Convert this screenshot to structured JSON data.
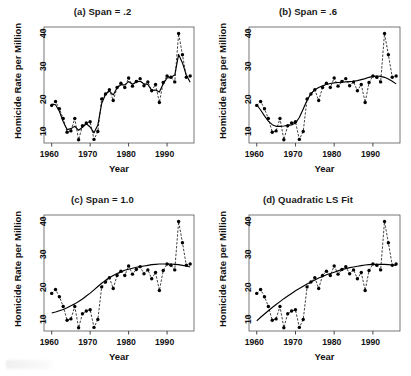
{
  "figure": {
    "caption_fragment": "",
    "xlabel": "Year",
    "ylabel": "Homicide Rate per Million",
    "xticks": [
      "1960",
      "1970",
      "1980",
      "1990"
    ],
    "yticks": [
      "10",
      "20",
      "30",
      "40"
    ]
  },
  "panels": [
    {
      "key": "a",
      "title": "(a) Span = .2"
    },
    {
      "key": "b",
      "title": "(b) Span = .6"
    },
    {
      "key": "c",
      "title": "(c) Span = 1.0"
    },
    {
      "key": "d",
      "title": "(d) Quadratic LS Fit"
    }
  ],
  "chart_data": [
    {
      "type": "line",
      "title": "(a) Span = .2",
      "xlabel": "Year",
      "ylabel": "Homicide Rate per Million",
      "xlim": [
        1958,
        1997
      ],
      "ylim": [
        5.5,
        41
      ],
      "xticks": [
        1960,
        1970,
        1980,
        1990
      ],
      "yticks": [
        10,
        20,
        30,
        40
      ],
      "grid": false,
      "legend": "none",
      "series": [
        {
          "name": "Homicide rate (observed)",
          "style": "points-with-dashed-line",
          "x": [
            1960,
            1961,
            1962,
            1963,
            1964,
            1965,
            1966,
            1967,
            1968,
            1969,
            1970,
            1971,
            1972,
            1973,
            1974,
            1975,
            1976,
            1977,
            1978,
            1979,
            1980,
            1981,
            1982,
            1983,
            1984,
            1985,
            1986,
            1987,
            1988,
            1989,
            1990,
            1991,
            1992,
            1993,
            1994,
            1995,
            1996
          ],
          "values": [
            17.0,
            18.2,
            16.0,
            13.0,
            8.8,
            9.2,
            13.0,
            6.5,
            10.8,
            11.6,
            12.0,
            6.6,
            9.0,
            19.0,
            20.5,
            21.8,
            18.5,
            22.5,
            23.8,
            22.5,
            25.4,
            22.9,
            24.3,
            25.2,
            23.0,
            24.2,
            21.5,
            23.4,
            17.9,
            24.0,
            26.0,
            25.6,
            24.2,
            39.0,
            32.5,
            25.6,
            26.0
          ]
        },
        {
          "name": "Loess smooth, span = .2",
          "style": "solid-line",
          "x": [
            1960,
            1961,
            1962,
            1963,
            1964,
            1965,
            1966,
            1967,
            1968,
            1969,
            1970,
            1971,
            1972,
            1973,
            1974,
            1975,
            1976,
            1977,
            1978,
            1979,
            1980,
            1981,
            1982,
            1983,
            1984,
            1985,
            1986,
            1987,
            1988,
            1989,
            1990,
            1991,
            1992,
            1993,
            1994,
            1995,
            1996
          ],
          "values": [
            17.4,
            17.2,
            15.2,
            12.0,
            9.6,
            9.9,
            10.6,
            9.4,
            10.3,
            11.4,
            10.4,
            8.6,
            11.0,
            17.6,
            20.4,
            21.4,
            20.2,
            22.4,
            23.3,
            23.3,
            24.3,
            23.5,
            24.2,
            24.4,
            23.6,
            23.4,
            21.6,
            21.7,
            21.1,
            23.6,
            25.4,
            25.6,
            26.3,
            32.6,
            30.0,
            26.3,
            24.1
          ]
        }
      ]
    },
    {
      "type": "line",
      "title": "(b) Span = .6",
      "xlabel": "Year",
      "ylabel": "Homicide Rate per Million",
      "xlim": [
        1958,
        1997
      ],
      "ylim": [
        5.5,
        41
      ],
      "xticks": [
        1960,
        1970,
        1980,
        1990
      ],
      "yticks": [
        10,
        20,
        30,
        40
      ],
      "grid": false,
      "legend": "none",
      "series": [
        {
          "name": "Homicide rate (observed)",
          "style": "points-with-dashed-line",
          "x": [
            1960,
            1961,
            1962,
            1963,
            1964,
            1965,
            1966,
            1967,
            1968,
            1969,
            1970,
            1971,
            1972,
            1973,
            1974,
            1975,
            1976,
            1977,
            1978,
            1979,
            1980,
            1981,
            1982,
            1983,
            1984,
            1985,
            1986,
            1987,
            1988,
            1989,
            1990,
            1991,
            1992,
            1993,
            1994,
            1995,
            1996
          ],
          "values": [
            17.0,
            18.2,
            16.0,
            13.0,
            8.8,
            9.2,
            13.0,
            6.5,
            10.8,
            11.6,
            12.0,
            6.6,
            9.0,
            19.0,
            20.5,
            21.8,
            18.5,
            22.5,
            23.8,
            22.5,
            25.4,
            22.9,
            24.3,
            25.2,
            23.0,
            24.2,
            21.5,
            23.4,
            17.9,
            24.0,
            26.0,
            25.6,
            24.2,
            39.0,
            32.5,
            25.6,
            26.0
          ]
        },
        {
          "name": "Loess smooth, span = .6",
          "style": "solid-line",
          "x": [
            1960,
            1961,
            1962,
            1963,
            1964,
            1965,
            1966,
            1967,
            1968,
            1969,
            1970,
            1971,
            1972,
            1973,
            1974,
            1975,
            1976,
            1977,
            1978,
            1979,
            1980,
            1981,
            1982,
            1983,
            1984,
            1985,
            1986,
            1987,
            1988,
            1989,
            1990,
            1991,
            1992,
            1993,
            1994,
            1995,
            1996
          ],
          "values": [
            17.2,
            15.6,
            13.8,
            12.2,
            11.1,
            10.6,
            10.6,
            10.7,
            10.9,
            11.0,
            11.6,
            13.3,
            15.9,
            18.6,
            20.6,
            21.8,
            22.5,
            23.0,
            23.4,
            23.7,
            23.9,
            24.0,
            24.1,
            24.2,
            24.3,
            24.4,
            24.6,
            24.9,
            25.2,
            25.6,
            25.9,
            26.0,
            25.9,
            25.6,
            25.1,
            24.4,
            23.6
          ]
        }
      ]
    },
    {
      "type": "line",
      "title": "(c) Span = 1.0",
      "xlabel": "Year",
      "ylabel": "Homicide Rate per Million",
      "xlim": [
        1958,
        1997
      ],
      "ylim": [
        5.5,
        41
      ],
      "xticks": [
        1960,
        1970,
        1980,
        1990
      ],
      "yticks": [
        10,
        20,
        30,
        40
      ],
      "grid": false,
      "legend": "none",
      "series": [
        {
          "name": "Homicide rate (observed)",
          "style": "points-with-dashed-line",
          "x": [
            1960,
            1961,
            1962,
            1963,
            1964,
            1965,
            1966,
            1967,
            1968,
            1969,
            1970,
            1971,
            1972,
            1973,
            1974,
            1975,
            1976,
            1977,
            1978,
            1979,
            1980,
            1981,
            1982,
            1983,
            1984,
            1985,
            1986,
            1987,
            1988,
            1989,
            1990,
            1991,
            1992,
            1993,
            1994,
            1995,
            1996
          ],
          "values": [
            17.0,
            18.2,
            16.0,
            13.0,
            8.8,
            9.2,
            13.0,
            6.5,
            10.8,
            11.6,
            12.0,
            6.6,
            9.0,
            19.0,
            20.5,
            21.8,
            18.5,
            22.5,
            23.8,
            22.5,
            25.4,
            22.9,
            24.3,
            25.2,
            23.0,
            24.2,
            21.5,
            23.4,
            17.9,
            24.0,
            26.0,
            25.6,
            24.2,
            39.0,
            32.5,
            25.6,
            26.0
          ]
        },
        {
          "name": "Loess smooth, span = 1.0",
          "style": "solid-line",
          "x": [
            1960,
            1961,
            1962,
            1963,
            1964,
            1965,
            1966,
            1967,
            1968,
            1969,
            1970,
            1971,
            1972,
            1973,
            1974,
            1975,
            1976,
            1977,
            1978,
            1979,
            1980,
            1981,
            1982,
            1983,
            1984,
            1985,
            1986,
            1987,
            1988,
            1989,
            1990,
            1991,
            1992,
            1993,
            1994,
            1995,
            1996
          ],
          "values": [
            11.0,
            11.3,
            11.7,
            12.1,
            12.6,
            13.2,
            13.8,
            14.5,
            15.3,
            16.2,
            17.1,
            18.1,
            19.1,
            20.1,
            21.0,
            21.8,
            22.5,
            23.1,
            23.6,
            24.1,
            24.4,
            24.7,
            25.0,
            25.2,
            25.4,
            25.6,
            25.8,
            25.9,
            26.0,
            26.0,
            26.0,
            26.0,
            25.9,
            25.8,
            25.6,
            25.4,
            25.1
          ]
        }
      ]
    },
    {
      "type": "line",
      "title": "(d) Quadratic LS Fit",
      "xlabel": "Year",
      "ylabel": "Homicide Rate per Million",
      "xlim": [
        1958,
        1997
      ],
      "ylim": [
        5.5,
        41
      ],
      "xticks": [
        1960,
        1970,
        1980,
        1990
      ],
      "yticks": [
        10,
        20,
        30,
        40
      ],
      "grid": false,
      "legend": "none",
      "series": [
        {
          "name": "Homicide rate (observed)",
          "style": "points-with-dashed-line",
          "x": [
            1960,
            1961,
            1962,
            1963,
            1964,
            1965,
            1966,
            1967,
            1968,
            1969,
            1970,
            1971,
            1972,
            1973,
            1974,
            1975,
            1976,
            1977,
            1978,
            1979,
            1980,
            1981,
            1982,
            1983,
            1984,
            1985,
            1986,
            1987,
            1988,
            1989,
            1990,
            1991,
            1992,
            1993,
            1994,
            1995,
            1996
          ],
          "values": [
            17.0,
            18.2,
            16.0,
            13.0,
            8.8,
            9.2,
            13.0,
            6.5,
            10.8,
            11.6,
            12.0,
            6.6,
            9.0,
            19.0,
            20.5,
            21.8,
            18.5,
            22.5,
            23.8,
            22.5,
            25.4,
            22.9,
            24.3,
            25.2,
            23.0,
            24.2,
            21.5,
            23.4,
            17.9,
            24.0,
            26.0,
            25.6,
            24.2,
            39.0,
            32.5,
            25.6,
            26.0
          ]
        },
        {
          "name": "Quadratic least-squares fit",
          "style": "solid-line",
          "x": [
            1960,
            1961,
            1962,
            1963,
            1964,
            1965,
            1966,
            1967,
            1968,
            1969,
            1970,
            1971,
            1972,
            1973,
            1974,
            1975,
            1976,
            1977,
            1978,
            1979,
            1980,
            1981,
            1982,
            1983,
            1984,
            1985,
            1986,
            1987,
            1988,
            1989,
            1990,
            1991,
            1992,
            1993,
            1994,
            1995,
            1996
          ],
          "values": [
            8.6,
            9.7,
            10.7,
            11.7,
            12.7,
            13.6,
            14.5,
            15.4,
            16.2,
            17.0,
            17.8,
            18.5,
            19.2,
            19.9,
            20.5,
            21.1,
            21.7,
            22.2,
            22.7,
            23.1,
            23.5,
            23.9,
            24.3,
            24.6,
            24.9,
            25.1,
            25.3,
            25.5,
            25.7,
            25.8,
            25.9,
            25.9,
            25.9,
            25.9,
            25.8,
            25.7,
            25.6
          ]
        }
      ]
    }
  ]
}
